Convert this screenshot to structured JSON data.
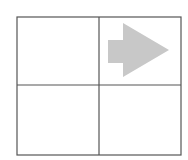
{
  "diagram": {
    "type": "grid-with-arrow",
    "grid": {
      "rows": 2,
      "cols": 2,
      "x": 17,
      "y": 17,
      "width": 164,
      "height": 138,
      "col_divider_x": 99,
      "row_divider_y": 85,
      "line_color": "#555555",
      "line_width": 1.2
    },
    "cells": [
      {
        "row": 0,
        "col": 0,
        "content": "empty"
      },
      {
        "row": 0,
        "col": 1,
        "content": "arrow-right"
      },
      {
        "row": 1,
        "col": 0,
        "content": "empty"
      },
      {
        "row": 1,
        "col": 1,
        "content": "empty"
      }
    ],
    "arrow": {
      "direction": "right",
      "fill": "#c8c8c8",
      "shaft": {
        "x1": 108,
        "x2": 123,
        "y1": 40,
        "y2": 63
      },
      "head": {
        "base_x": 123,
        "top_y": 23,
        "bottom_y": 77,
        "tip_x": 169,
        "tip_y": 50
      }
    }
  }
}
